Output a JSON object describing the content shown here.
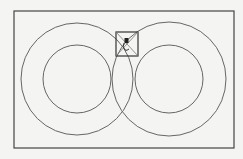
{
  "diagram": {
    "background": "#f4f4f2",
    "stroke_color": "#555555",
    "frame": {
      "x": 14,
      "y": 11,
      "w": 220,
      "h": 137
    },
    "left_circles": {
      "cx": 77,
      "cy": 79,
      "r_outer": 56,
      "r_inner": 34
    },
    "right_circles": {
      "cx": 169,
      "cy": 79,
      "r_outer": 57,
      "r_inner": 34
    },
    "center_box": {
      "x": 116,
      "y": 32,
      "w": 22,
      "h": 24
    },
    "marker": "figure-marker"
  }
}
